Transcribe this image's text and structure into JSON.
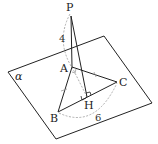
{
  "diagram": {
    "type": "3d-geometry",
    "plane_label": "α",
    "points": {
      "P": {
        "label": "P",
        "x": 71,
        "y": 12
      },
      "A": {
        "label": "A",
        "x": 72,
        "y": 67
      },
      "B": {
        "label": "B",
        "x": 58,
        "y": 112
      },
      "C": {
        "label": "C",
        "x": 117,
        "y": 82
      },
      "H": {
        "label": "H",
        "x": 87,
        "y": 97
      }
    },
    "segments": [
      "PA",
      "PH",
      "AB",
      "AC",
      "BC",
      "AH"
    ],
    "measurements": {
      "PA": "4",
      "BC": "6"
    },
    "marks": {
      "equal_sides": [
        "AB",
        "AC"
      ],
      "right_angles": [
        "PAH",
        "PHC"
      ]
    },
    "colors": {
      "line": "#222222",
      "dashed": "#9a9a9a"
    }
  }
}
